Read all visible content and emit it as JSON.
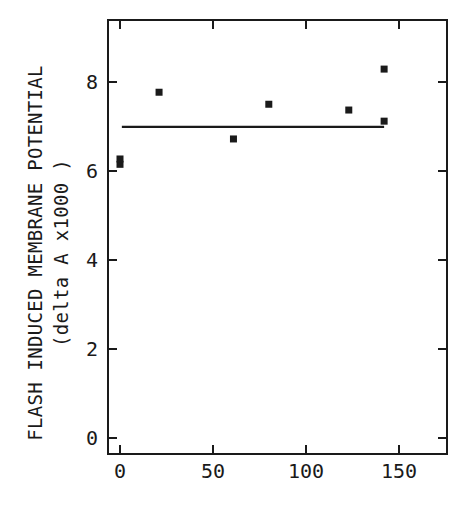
{
  "chart_data": {
    "type": "scatter",
    "title": "",
    "xlabel": "",
    "ylabel": "FLASH INDUCED MEMBRANE POTENTIAL",
    "ylabel_sub": "(delta A x1000 )",
    "xlim": [
      -7,
      176
    ],
    "ylim": [
      -0.35,
      9.4
    ],
    "xticks": [
      0,
      50,
      100,
      150
    ],
    "xtick_labels": [
      "0",
      "50",
      "100",
      "150"
    ],
    "yticks": [
      0,
      2,
      4,
      6,
      8
    ],
    "ytick_labels": [
      "0",
      "2",
      "4",
      "6",
      "8"
    ],
    "grid": false,
    "legend": null,
    "series": [
      {
        "name": "measurements",
        "marker": "square",
        "points": [
          {
            "x": 0,
            "y": 6.15
          },
          {
            "x": 0,
            "y": 6.27
          },
          {
            "x": 21,
            "y": 7.77
          },
          {
            "x": 61,
            "y": 6.72
          },
          {
            "x": 80,
            "y": 7.5
          },
          {
            "x": 123,
            "y": 7.37
          },
          {
            "x": 142,
            "y": 8.29
          },
          {
            "x": 142,
            "y": 7.12
          }
        ]
      },
      {
        "name": "mean",
        "type": "line",
        "points": [
          {
            "x": 1,
            "y": 6.99
          },
          {
            "x": 142,
            "y": 6.99
          }
        ]
      }
    ]
  },
  "labels": {
    "ylabel_line1": "FLASH INDUCED MEMBRANE POTENTIAL",
    "ylabel_line2": "(delta A x1000 )"
  },
  "colors": {
    "ink": "#1a1a1a",
    "background": "#ffffff"
  }
}
